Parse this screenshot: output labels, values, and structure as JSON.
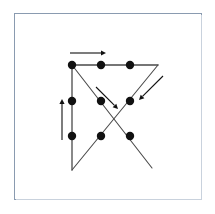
{
  "figure": {
    "frame": {
      "x": 14,
      "y": 13,
      "width": 188,
      "height": 187,
      "border_color": "#8a9bb0",
      "background_color": "#ffffff"
    },
    "colors": {
      "dot": "#111111",
      "line": "#4a4a4a",
      "arrow": "#111111",
      "frame": "#8a9bb0",
      "background": "#ffffff"
    },
    "dot_radius": 4.2,
    "dots": [
      {
        "id": "dot-r1c1",
        "label": "top-left",
        "x": 72,
        "y": 65
      },
      {
        "id": "dot-r1c2",
        "label": "top-center",
        "x": 101,
        "y": 65
      },
      {
        "id": "dot-r1c3",
        "label": "top-right",
        "x": 130,
        "y": 65
      },
      {
        "id": "dot-r2c1",
        "label": "middle-left",
        "x": 72,
        "y": 101
      },
      {
        "id": "dot-r2c2",
        "label": "middle-center",
        "x": 101,
        "y": 101
      },
      {
        "id": "dot-r2c3",
        "label": "middle-right",
        "x": 130,
        "y": 101
      },
      {
        "id": "dot-r3c1",
        "label": "bottom-left",
        "x": 72,
        "y": 136
      },
      {
        "id": "dot-r3c2",
        "label": "bottom-center",
        "x": 101,
        "y": 136
      },
      {
        "id": "dot-r3c3",
        "label": "bottom-right",
        "x": 130,
        "y": 136
      }
    ],
    "strokes": [
      {
        "id": "stroke-top-horizontal",
        "label": "top horizontal line",
        "x1": 72,
        "y1": 65,
        "x2": 158,
        "y2": 65,
        "width": 1.3
      },
      {
        "id": "stroke-diagonal-down-left",
        "label": "diagonal from top-right area down to bottom-left",
        "x1": 158,
        "y1": 65,
        "x2": 72,
        "y2": 170,
        "width": 1.1
      },
      {
        "id": "stroke-left-vertical",
        "label": "left vertical line",
        "x1": 72,
        "y1": 170,
        "x2": 72,
        "y2": 65,
        "width": 1.3
      },
      {
        "id": "stroke-diagonal-down-right",
        "label": "diagonal from top-left down to bottom-right",
        "x1": 72,
        "y1": 65,
        "x2": 152,
        "y2": 168,
        "width": 1.1
      }
    ],
    "arrows": [
      {
        "id": "arrow-top-right",
        "label": "rightward arrow above top row",
        "direction": "right",
        "x1": 70,
        "y1": 53,
        "x2": 106,
        "y2": 53,
        "width": 1.1,
        "head_size": 5
      },
      {
        "id": "arrow-left-up",
        "label": "upward arrow left of first column",
        "direction": "up",
        "x1": 62,
        "y1": 140,
        "x2": 62,
        "y2": 99,
        "width": 1.1,
        "head_size": 5
      },
      {
        "id": "arrow-diagonal-down-right",
        "label": "down-right arrow along inner diagonal",
        "direction": "down-right",
        "x1": 96,
        "y1": 87,
        "x2": 118,
        "y2": 109,
        "width": 1.1,
        "head_size": 5
      },
      {
        "id": "arrow-diagonal-down-left",
        "label": "down-left arrow along outer right diagonal",
        "direction": "down-left",
        "x1": 163,
        "y1": 76,
        "x2": 139,
        "y2": 100,
        "width": 1.1,
        "head_size": 5
      }
    ]
  }
}
